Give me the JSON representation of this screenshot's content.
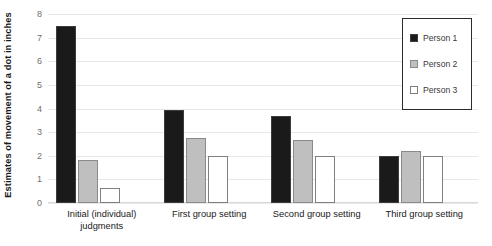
{
  "chart_data": {
    "type": "bar",
    "title": "",
    "xlabel": "",
    "ylabel": "Estimates of movement of a dot in inches",
    "ylim": [
      0,
      8
    ],
    "yticks": [
      0,
      1,
      2,
      3,
      4,
      5,
      6,
      7,
      8
    ],
    "grid": true,
    "legend_position": "top-right",
    "categories": [
      "Initial (individual) judgments",
      "First group setting",
      "Second group setting",
      "Third group setting"
    ],
    "series": [
      {
        "name": "Person 1",
        "color": "#1A1A1A",
        "values": [
          7.5,
          3.95,
          3.7,
          2.0
        ]
      },
      {
        "name": "Person 2",
        "color": "#BFBFBF",
        "values": [
          1.8,
          2.75,
          2.65,
          2.2
        ]
      },
      {
        "name": "Person 3",
        "color": "#FFFFFF",
        "values": [
          0.65,
          2.0,
          2.0,
          2.0
        ]
      }
    ]
  },
  "legend": {
    "items": [
      {
        "label": "Person 1"
      },
      {
        "label": "Person 2"
      },
      {
        "label": "Person 3"
      }
    ]
  }
}
